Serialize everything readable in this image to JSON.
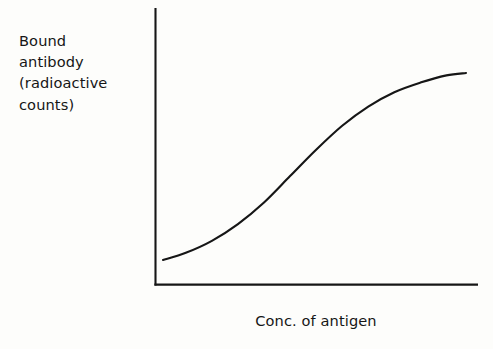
{
  "figure": {
    "background_color": "#fdfdfb",
    "ink_color": "#161616",
    "width": 493,
    "height": 349
  },
  "labels": {
    "y_axis_line_1": "Bound",
    "y_axis_line_2": "antibody",
    "y_axis_line_3": "(radioactive",
    "y_axis_line_4": "counts)",
    "x_axis": "Conc. of antigen"
  },
  "chart_data": {
    "type": "line",
    "title": "",
    "subtitle": "",
    "xlabel": "Conc. of antigen",
    "ylabel": "Bound antibody (radioactive counts)",
    "curve_shape": "sigmoid",
    "grid": false,
    "legend": false,
    "legend_position": "none",
    "tick_labels_x": [],
    "tick_labels_y": [],
    "tick_marks": false,
    "axis_spines": [
      "left",
      "bottom"
    ],
    "xlim": [
      0,
      1
    ],
    "ylim": [
      0,
      1
    ],
    "series": [
      {
        "name": "Bound antibody",
        "x": [
          0.03,
          0.1,
          0.18,
          0.26,
          0.34,
          0.42,
          0.5,
          0.58,
          0.66,
          0.74,
          0.82,
          0.9,
          0.96
        ],
        "y": [
          0.09,
          0.12,
          0.17,
          0.24,
          0.33,
          0.44,
          0.55,
          0.65,
          0.73,
          0.79,
          0.83,
          0.86,
          0.87
        ],
        "line_color": "#161616",
        "line_width": 2,
        "markers": "none",
        "fill": "none"
      }
    ],
    "pixel_geometry": {
      "y_axis_x": 155,
      "y_axis_top_y": 8,
      "x_axis_y": 285,
      "x_axis_right_x": 478,
      "curve_start": [
        163,
        260
      ],
      "curve_end": [
        466,
        73
      ],
      "curve_inflection": [
        300,
        176
      ]
    }
  }
}
